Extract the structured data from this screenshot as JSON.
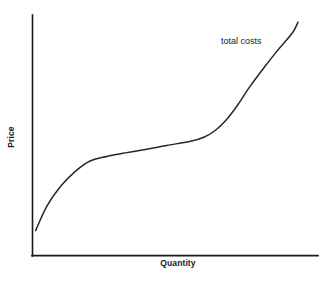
{
  "chart_data": {
    "type": "line",
    "title": "",
    "subtitle": "",
    "xlabel": "Quantity",
    "ylabel": "Price",
    "grid": false,
    "legend_position": "inline-annotation",
    "axis_style": "open-L-axes-no-ticks",
    "xlim": [
      0,
      1
    ],
    "ylim": [
      0,
      1
    ],
    "x_ticks": [],
    "y_ticks": [],
    "annotations": [
      {
        "text": "total costs",
        "x": 0.66,
        "y": 0.93,
        "anchor": "curve-upper-right"
      }
    ],
    "series": [
      {
        "name": "total costs",
        "color": "#262626",
        "shape": "cubic-S-curve",
        "description": "Concave rise, flat plateau through middle, then convex steep ascent",
        "x": [
          0.011,
          0.05,
          0.1,
          0.15,
          0.2,
          0.26,
          0.33,
          0.4,
          0.47,
          0.55,
          0.6,
          0.64,
          0.68,
          0.72,
          0.76,
          0.81,
          0.86,
          0.91,
          0.93
        ],
        "y": [
          0.104,
          0.205,
          0.29,
          0.35,
          0.392,
          0.412,
          0.428,
          0.442,
          0.458,
          0.474,
          0.492,
          0.52,
          0.566,
          0.628,
          0.7,
          0.78,
          0.855,
          0.925,
          0.97
        ]
      }
    ]
  },
  "labels": {
    "y_axis": "Price",
    "x_axis": "Quantity",
    "curve": "total costs"
  },
  "colors": {
    "background": "#ffffff",
    "axis": "#1a1a1a",
    "curve": "#262626",
    "text": "#1a1a1a"
  }
}
